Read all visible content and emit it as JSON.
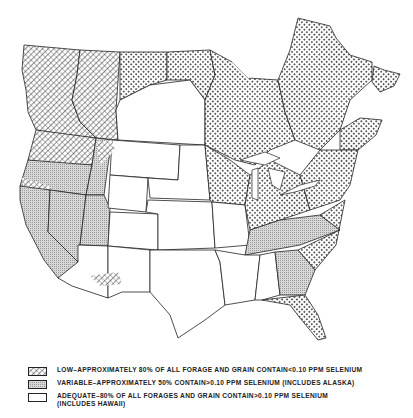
{
  "map": {
    "title": "",
    "region": "United States and Canada",
    "subject": "Selenium content of forages and grains",
    "categories": [
      {
        "key": "low",
        "pattern": "crosshatch",
        "label": "LOW–APPROXIMATELY 80% OF ALL FORAGE AND GRAIN CONTAIN<0.10 PPM SELENIUM"
      },
      {
        "key": "variable",
        "pattern": "fine-stipple",
        "label": "VARIABLE–APPROXIMATELY 50% CONTAIN>0.10 PPM SELENIUM (INCLUDES ALASKA)"
      },
      {
        "key": "adequate",
        "pattern": "blank",
        "label_line1": "ADEQUATE–80% OF ALL FORAGES AND GRAIN CONTAIN>0.10 PPM SELENIUM",
        "label_line2": "(INCLUDES HAWAII)"
      }
    ]
  },
  "colors": {
    "ink": "#222222",
    "background": "#ffffff",
    "stipple": "#bdbdbd"
  }
}
